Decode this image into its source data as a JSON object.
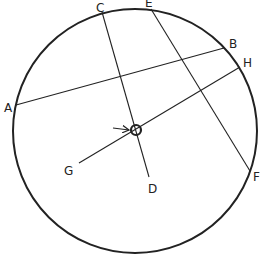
{
  "diagram": {
    "type": "geometry-circle-chords",
    "stroke_color": "#222222",
    "background": "#ffffff",
    "big_circle": {
      "cx": 135,
      "cy": 131,
      "r": 122
    },
    "center_marker": {
      "cx": 136,
      "cy": 130,
      "r": 5
    },
    "arrow": {
      "x1": 113,
      "y1": 128,
      "x2": 129,
      "y2": 130
    },
    "points": {
      "A": {
        "x": 16,
        "y": 105,
        "label": "A",
        "lx": 4,
        "ly": 112
      },
      "B": {
        "x": 224,
        "y": 48,
        "label": "B",
        "lx": 229,
        "ly": 48
      },
      "C": {
        "x": 102,
        "y": 12,
        "label": "C",
        "lx": 96,
        "ly": 12
      },
      "D": {
        "x": 149,
        "y": 177,
        "label": "D",
        "lx": 148,
        "ly": 193
      },
      "E": {
        "x": 151,
        "y": 9,
        "label": "E",
        "lx": 145,
        "ly": 7
      },
      "F": {
        "x": 250,
        "y": 171,
        "label": "F",
        "lx": 253,
        "ly": 181
      },
      "G": {
        "x": 79,
        "y": 163,
        "label": "G",
        "lx": 64,
        "ly": 175
      },
      "H": {
        "x": 240,
        "y": 67,
        "label": "H",
        "lx": 243,
        "ly": 67
      }
    },
    "segments": [
      {
        "name": "chord-AB",
        "from": "A",
        "to": "B"
      },
      {
        "name": "segment-CD",
        "from": "C",
        "to": "D"
      },
      {
        "name": "chord-EF",
        "from": "E",
        "to": "F"
      },
      {
        "name": "segment-GH",
        "from": "G",
        "to": "H"
      }
    ]
  }
}
